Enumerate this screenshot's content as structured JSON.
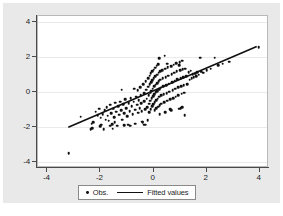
{
  "chart_data": {
    "type": "scatter",
    "title": "",
    "xlabel": "",
    "ylabel": "",
    "xlim": [
      -4.35,
      4.35
    ],
    "ylim": [
      -4.35,
      4.35
    ],
    "xticks": [
      -4,
      -2,
      0,
      2,
      4
    ],
    "yticks": [
      -4,
      -2,
      0,
      2,
      4
    ],
    "xtick_labels": [
      "-4",
      "-2",
      "0",
      "2",
      "4"
    ],
    "ytick_labels": [
      "-4",
      "-2",
      "0",
      "2",
      "4"
    ],
    "grid": "horizontal",
    "legend_position": "below-plot",
    "marker_color": "#101010",
    "line_color": "#101010",
    "grid_color": "#eaeaea",
    "axis_color": "#4a4a4a",
    "plot_background": "#ffffff",
    "canvas_background": "#e9e9e9",
    "series": [
      {
        "name": "Obs.",
        "type": "scatter",
        "marker": "circle",
        "points": [
          [
            -3.2,
            -3.52
          ],
          [
            -2.74,
            -1.42
          ],
          [
            -2.36,
            -2.14
          ],
          [
            -2.3,
            -2.08
          ],
          [
            -2.33,
            -1.82
          ],
          [
            -2.27,
            -1.74
          ],
          [
            -2.18,
            -1.12
          ],
          [
            -2.1,
            -1.32
          ],
          [
            -2.05,
            -0.96
          ],
          [
            -1.99,
            -1.48
          ],
          [
            -1.96,
            -1.88
          ],
          [
            -1.92,
            -1.26
          ],
          [
            -1.88,
            -2.12
          ],
          [
            -1.84,
            -1.05
          ],
          [
            -1.8,
            -1.58
          ],
          [
            -1.76,
            -0.88
          ],
          [
            -1.72,
            -1.36
          ],
          [
            -1.68,
            -1.64
          ],
          [
            -1.64,
            -0.72
          ],
          [
            -1.6,
            -1.2
          ],
          [
            -1.56,
            -1.84
          ],
          [
            -1.52,
            -0.96
          ],
          [
            -1.48,
            -1.44
          ],
          [
            -1.44,
            -0.62
          ],
          [
            -1.4,
            -1.12
          ],
          [
            -1.36,
            -1.92
          ],
          [
            -1.33,
            -0.8
          ],
          [
            -1.3,
            -1.3
          ],
          [
            -1.26,
            -0.55
          ],
          [
            -1.22,
            -1.05
          ],
          [
            -1.18,
            -1.58
          ],
          [
            -1.14,
            -0.7
          ],
          [
            -1.1,
            -1.22
          ],
          [
            -1.06,
            -0.42
          ],
          [
            -1.02,
            -0.92
          ],
          [
            -0.98,
            -1.4
          ],
          [
            -0.96,
            -1.88
          ],
          [
            -0.94,
            -0.64
          ],
          [
            -0.9,
            -1.1
          ],
          [
            -0.86,
            -0.34
          ],
          [
            -0.82,
            -0.82
          ],
          [
            -0.78,
            -1.28
          ],
          [
            -0.74,
            -0.56
          ],
          [
            -0.7,
            -1.02
          ],
          [
            -0.68,
            -1.82
          ],
          [
            -0.66,
            -0.26
          ],
          [
            -0.62,
            -0.72
          ],
          [
            -0.58,
            -1.18
          ],
          [
            -0.55,
            -0.46
          ],
          [
            -0.52,
            -0.92
          ],
          [
            -0.5,
            0.28
          ],
          [
            -0.48,
            -0.18
          ],
          [
            -0.46,
            -0.64
          ],
          [
            -0.44,
            -1.1
          ],
          [
            -0.42,
            -1.7
          ],
          [
            -0.4,
            -1.72
          ],
          [
            -0.38,
            0.46
          ],
          [
            -0.36,
            -0.06
          ],
          [
            -0.34,
            -0.52
          ],
          [
            -0.32,
            -0.98
          ],
          [
            -0.3,
            0.62
          ],
          [
            -0.28,
            0.12
          ],
          [
            -0.26,
            -0.38
          ],
          [
            -0.24,
            -0.86
          ],
          [
            -0.22,
            -1.62
          ],
          [
            -0.2,
            0.78
          ],
          [
            -0.19,
            0.3
          ],
          [
            -0.18,
            -0.2
          ],
          [
            -0.17,
            -0.68
          ],
          [
            -0.16,
            -1.14
          ],
          [
            -0.15,
            0.94
          ],
          [
            -0.14,
            0.44
          ],
          [
            -0.13,
            -0.04
          ],
          [
            -0.12,
            -0.5
          ],
          [
            -0.11,
            -0.98
          ],
          [
            -0.1,
            1.06
          ],
          [
            -0.09,
            0.56
          ],
          [
            -0.08,
            0.08
          ],
          [
            -0.07,
            -0.36
          ],
          [
            -0.06,
            -0.82
          ],
          [
            -0.05,
            1.18
          ],
          [
            -0.04,
            0.68
          ],
          [
            -0.03,
            0.2
          ],
          [
            -0.02,
            -0.24
          ],
          [
            -0.01,
            -0.7
          ],
          [
            0.0,
            1.28
          ],
          [
            0.01,
            0.8
          ],
          [
            0.02,
            0.32
          ],
          [
            0.03,
            -0.12
          ],
          [
            0.04,
            -0.58
          ],
          [
            0.05,
            -1.04
          ],
          [
            0.06,
            1.4
          ],
          [
            0.07,
            0.9
          ],
          [
            0.08,
            0.42
          ],
          [
            0.09,
            -0.02
          ],
          [
            0.1,
            -0.46
          ],
          [
            0.11,
            -0.92
          ],
          [
            0.12,
            1.5
          ],
          [
            0.13,
            1.0
          ],
          [
            0.14,
            0.52
          ],
          [
            0.15,
            0.06
          ],
          [
            0.16,
            -0.38
          ],
          [
            0.17,
            -0.84
          ],
          [
            0.18,
            1.6
          ],
          [
            0.19,
            1.1
          ],
          [
            0.2,
            0.62
          ],
          [
            0.21,
            0.16
          ],
          [
            0.22,
            -0.28
          ],
          [
            0.23,
            -0.74
          ],
          [
            0.24,
            -1.28
          ],
          [
            0.25,
            1.18
          ],
          [
            0.26,
            0.7
          ],
          [
            0.27,
            0.24
          ],
          [
            0.28,
            -0.2
          ],
          [
            0.3,
            -0.66
          ],
          [
            0.32,
            1.26
          ],
          [
            0.34,
            0.78
          ],
          [
            0.36,
            0.32
          ],
          [
            0.38,
            -0.14
          ],
          [
            0.4,
            -0.58
          ],
          [
            0.42,
            2.08
          ],
          [
            0.44,
            1.34
          ],
          [
            0.46,
            0.86
          ],
          [
            0.48,
            0.4
          ],
          [
            0.5,
            -0.06
          ],
          [
            0.52,
            -0.5
          ],
          [
            0.54,
            1.42
          ],
          [
            0.56,
            0.94
          ],
          [
            0.58,
            0.48
          ],
          [
            0.6,
            0.02
          ],
          [
            0.62,
            -0.42
          ],
          [
            0.64,
            -1.0
          ],
          [
            0.66,
            1.48
          ],
          [
            0.68,
            1.02
          ],
          [
            0.7,
            0.56
          ],
          [
            0.72,
            0.1
          ],
          [
            0.74,
            -0.34
          ],
          [
            0.76,
            1.56
          ],
          [
            0.78,
            1.1
          ],
          [
            0.8,
            0.64
          ],
          [
            0.82,
            0.18
          ],
          [
            0.84,
            -0.26
          ],
          [
            0.86,
            1.64
          ],
          [
            0.88,
            1.18
          ],
          [
            0.9,
            0.72
          ],
          [
            0.92,
            0.26
          ],
          [
            0.94,
            -0.18
          ],
          [
            0.96,
            -0.96
          ],
          [
            0.98,
            1.72
          ],
          [
            1.0,
            1.24
          ],
          [
            1.02,
            0.78
          ],
          [
            1.04,
            0.34
          ],
          [
            1.06,
            -0.1
          ],
          [
            1.08,
            1.78
          ],
          [
            1.1,
            1.3
          ],
          [
            1.12,
            0.86
          ],
          [
            1.14,
            0.4
          ],
          [
            1.16,
            -0.04
          ],
          [
            1.18,
            -1.32
          ],
          [
            1.2,
            1.34
          ],
          [
            1.24,
            0.9
          ],
          [
            1.28,
            0.46
          ],
          [
            1.32,
            1.14
          ],
          [
            1.36,
            0.7
          ],
          [
            1.4,
            1.22
          ],
          [
            1.44,
            0.78
          ],
          [
            1.48,
            1.02
          ],
          [
            1.52,
            0.84
          ],
          [
            1.56,
            1.04
          ],
          [
            1.6,
            0.92
          ],
          [
            1.64,
            1.12
          ],
          [
            1.7,
            0.98
          ],
          [
            1.76,
            1.96
          ],
          [
            1.8,
            1.16
          ],
          [
            1.88,
            1.1
          ],
          [
            2.0,
            1.26
          ],
          [
            2.16,
            1.34
          ],
          [
            2.3,
            1.96
          ],
          [
            2.44,
            1.52
          ],
          [
            2.6,
            1.62
          ],
          [
            2.86,
            1.74
          ],
          [
            3.96,
            2.58
          ],
          [
            -1.2,
            0.14
          ],
          [
            -0.6,
            0.1
          ],
          [
            -0.88,
            -1.94
          ],
          [
            -1.1,
            -1.9
          ],
          [
            -1.54,
            -2.1
          ],
          [
            -2.0,
            -1.96
          ],
          [
            -0.34,
            -1.88
          ],
          [
            -0.3,
            -1.88
          ],
          [
            1.02,
            -0.92
          ],
          [
            1.08,
            -0.88
          ],
          [
            0.66,
            -1.04
          ],
          [
            -1.46,
            -1.72
          ],
          [
            -1.62,
            -1.94
          ],
          [
            0.22,
            1.92
          ],
          [
            0.52,
            1.62
          ],
          [
            0.96,
            1.52
          ],
          [
            -0.72,
            0.18
          ],
          [
            0.44,
            -1.14
          ]
        ]
      },
      {
        "name": "Fitted values",
        "type": "line",
        "x_start": -3.2,
        "y_start": -2.1,
        "x_end": 3.96,
        "y_end": 2.58,
        "slope": 0.653,
        "intercept": -0.01
      }
    ],
    "legend": [
      {
        "label": "Obs.",
        "marker": "dot"
      },
      {
        "label": "Fitted values",
        "marker": "line"
      }
    ]
  }
}
